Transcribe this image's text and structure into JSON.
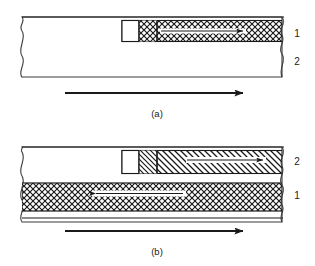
{
  "figure": {
    "type": "technical-cross-section-diagram",
    "background_color": "#ffffff",
    "line_color": "#1a1a1a",
    "panels": [
      {
        "id": "a",
        "caption": "(a)",
        "layer_labels": [
          "1",
          "2"
        ],
        "layer_label_top": "1",
        "layer_label_bottom": "2",
        "top_layer_pattern": "cross-hatch",
        "bottom_layer_pattern": "plain",
        "inclusion": {
          "white_block": "white-rectangle",
          "hatched_block": "cross-hatch-block",
          "inner_arrow_direction": "right"
        },
        "process_arrow_direction": "right"
      },
      {
        "id": "b",
        "caption": "(b)",
        "layer_labels": [
          "2",
          "1"
        ],
        "layer_label_top": "2",
        "layer_label_bottom": "1",
        "top_layer_pattern": "diagonal-hatch",
        "bottom_layer_pattern": "cross-hatch",
        "inclusion": {
          "white_block": "white-rectangle",
          "hatched_block": "diagonal-hatch-block",
          "inner_arrow_direction": "right"
        },
        "lower_band_arrow_direction": "left",
        "process_arrow_direction": "right"
      }
    ]
  }
}
